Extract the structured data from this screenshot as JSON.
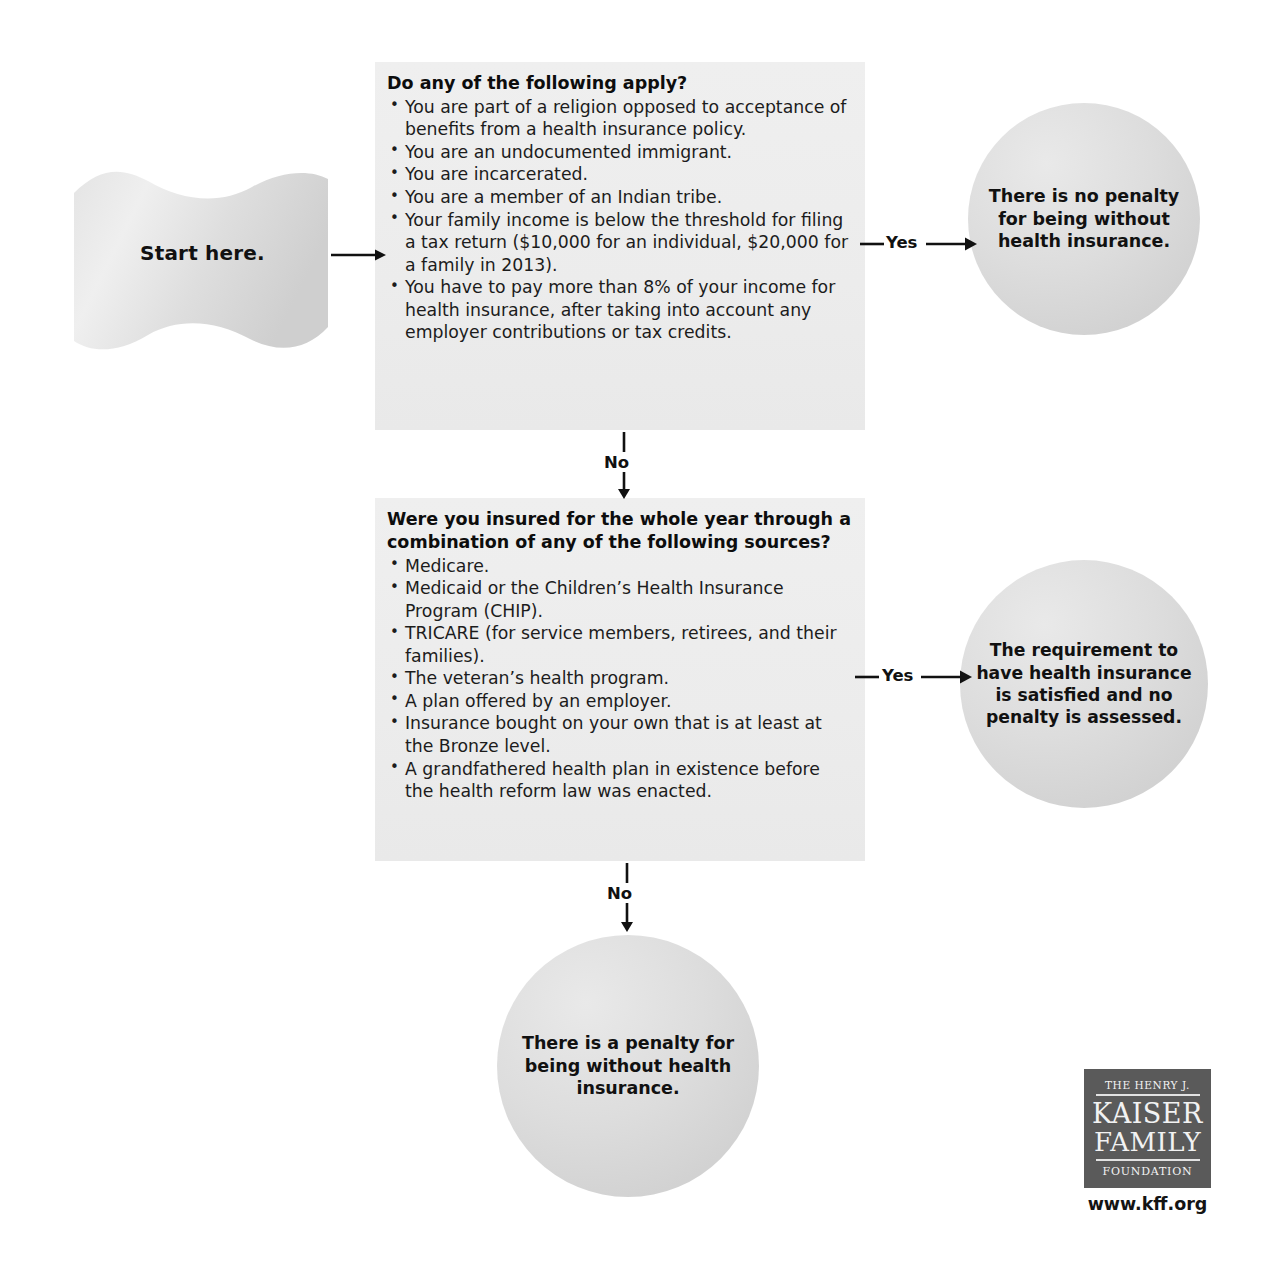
{
  "diagram": {
    "start": {
      "label": "Start here."
    },
    "questions": [
      {
        "title": "Do any of the following apply?",
        "items": [
          "You are part of a religion opposed to acceptance of benefits from a health insurance policy.",
          "You are an undocumented immigrant.",
          "You are incarcerated.",
          "You are a member of an Indian tribe.",
          "Your family income is below the threshold for filing a tax return ($10,000 for an individual, $20,000 for a family in 2013).",
          "You have to pay more than 8% of your income for health insurance, after taking into account any employer contributions or tax credits."
        ]
      },
      {
        "title": "Were you insured for the whole year through a combination of any of the following sources?",
        "items": [
          "Medicare.",
          "Medicaid or the Children’s Health Insurance Program (CHIP).",
          "TRICARE (for service members, retirees, and their families).",
          "The veteran’s health program.",
          "A plan offered by an employer.",
          "Insurance bought on your own that is at least at the Bronze level.",
          "A grandfathered health plan in existence before the health reform law was enacted."
        ]
      }
    ],
    "outcomes": [
      {
        "text": "There is no penalty for being without health insurance."
      },
      {
        "text": "The requirement to have health insurance is satisfied and no penalty is assessed."
      },
      {
        "text": "There is a penalty for being without health insurance."
      }
    ],
    "edges": {
      "yes_1": "Yes",
      "no_1": "No",
      "yes_2": "Yes",
      "no_2": "No"
    },
    "bullet_glyph": "•",
    "colors": {
      "box_fill": "#ececec",
      "circle_fill": "#d8d8d8",
      "logo_fill": "#5a5a5a",
      "text": "#111111"
    }
  },
  "logo": {
    "line1": "THE HENRY J.",
    "line2": "KAISER",
    "line3": "FAMILY",
    "line4": "FOUNDATION",
    "url": "www.kff.org"
  }
}
